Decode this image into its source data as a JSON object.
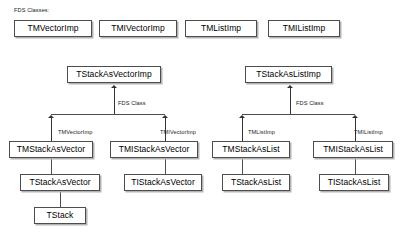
{
  "diagram": {
    "title_label": "FDS Classes:",
    "edge_color": "#4d4d4d",
    "box_border_color": "#4d4d4d",
    "box_fill_color": "#ffffff",
    "box_shadow_color": "#b3b3b3",
    "text_color": "#000000",
    "fds_classes": [
      {
        "label": "TMVectorImp",
        "x": 14,
        "y": 20,
        "w": 78,
        "h": 17
      },
      {
        "label": "TMIVectorImp",
        "x": 99,
        "y": 20,
        "w": 78,
        "h": 17
      },
      {
        "label": "TMListImp",
        "x": 185,
        "y": 20,
        "w": 72,
        "h": 17
      },
      {
        "label": "TMIListImp",
        "x": 268,
        "y": 20,
        "w": 72,
        "h": 17
      }
    ],
    "imp_classes": [
      {
        "label": "TStackAsVectorImp",
        "x": 67,
        "y": 66,
        "w": 94,
        "h": 17
      },
      {
        "label": "TStackAsListImp",
        "x": 245,
        "y": 66,
        "w": 87,
        "h": 17
      }
    ],
    "template_classes": [
      {
        "label": "TMStackAsVector",
        "x": 9,
        "y": 141,
        "w": 84,
        "h": 17
      },
      {
        "label": "TMIStackAsVector",
        "x": 110,
        "y": 141,
        "w": 88,
        "h": 17
      },
      {
        "label": "TMStackAsList",
        "x": 212,
        "y": 141,
        "w": 78,
        "h": 17
      },
      {
        "label": "TMIStackAsList",
        "x": 313,
        "y": 141,
        "w": 80,
        "h": 17
      }
    ],
    "concrete_classes": [
      {
        "label": "TStackAsVector",
        "x": 20,
        "y": 174,
        "w": 80,
        "h": 17
      },
      {
        "label": "TIStackAsVector",
        "x": 124,
        "y": 174,
        "w": 78,
        "h": 17
      },
      {
        "label": "TStackAsList",
        "x": 222,
        "y": 174,
        "w": 68,
        "h": 17
      },
      {
        "label": "TIStackAsList",
        "x": 319,
        "y": 174,
        "w": 70,
        "h": 17
      }
    ],
    "base_classes": [
      {
        "label": "TStack",
        "x": 34,
        "y": 207,
        "w": 52,
        "h": 17
      }
    ],
    "edge_labels": [
      {
        "text": "FDS Class",
        "x": 118,
        "y": 101
      },
      {
        "text": "FDS Class",
        "x": 296,
        "y": 101
      },
      {
        "text": "TMVectorImp",
        "x": 58,
        "y": 130
      },
      {
        "text": "TMIVectorImp",
        "x": 160,
        "y": 130
      },
      {
        "text": "TMListImp",
        "x": 248,
        "y": 130
      },
      {
        "text": "TMIListImp",
        "x": 354,
        "y": 130
      }
    ]
  }
}
